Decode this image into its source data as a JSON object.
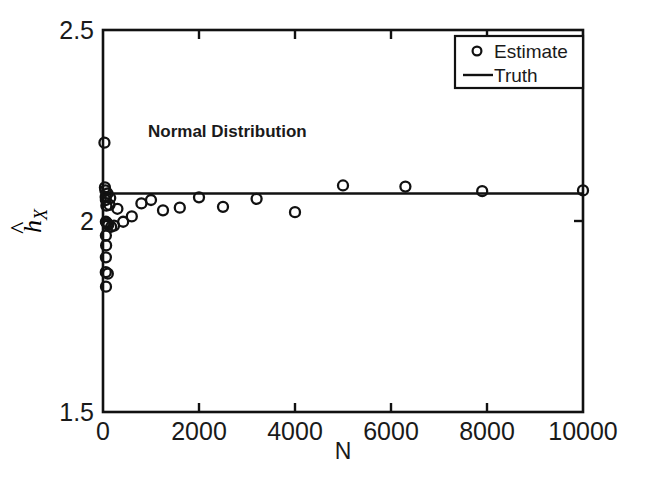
{
  "chart_data": {
    "type": "scatter",
    "title": "",
    "annotation": "Normal Distribution",
    "xlabel": "N",
    "ylabel": "ĥ_X",
    "xlim": [
      0,
      10000
    ],
    "ylim": [
      1.5,
      2.5
    ],
    "xticks": [
      0,
      2000,
      4000,
      6000,
      8000,
      10000
    ],
    "xticklabels": [
      "0",
      "2000",
      "4000",
      "6000",
      "8000",
      "10000"
    ],
    "yticks": [
      1.5,
      2.0,
      2.5
    ],
    "yticklabels": [
      "1.5",
      "2",
      "2.5"
    ],
    "grid": false,
    "legend_position": "upper right",
    "series": [
      {
        "name": "Estimate",
        "type": "scatter",
        "marker": "open-circle",
        "color": "#111111",
        "points": [
          [
            30,
            2.205
          ],
          [
            40,
            2.088
          ],
          [
            50,
            2.08
          ],
          [
            55,
            2.063
          ],
          [
            60,
            2.055
          ],
          [
            95,
            2.072
          ],
          [
            150,
            2.06
          ],
          [
            70,
            2.04
          ],
          [
            135,
            2.042
          ],
          [
            60,
            1.998
          ],
          [
            75,
            1.996
          ],
          [
            95,
            1.992
          ],
          [
            110,
            1.99
          ],
          [
            170,
            1.985
          ],
          [
            230,
            1.988
          ],
          [
            300,
            2.032
          ],
          [
            60,
            1.962
          ],
          [
            65,
            1.936
          ],
          [
            60,
            1.905
          ],
          [
            58,
            1.866
          ],
          [
            100,
            1.862
          ],
          [
            62,
            1.828
          ],
          [
            420,
            1.998
          ],
          [
            600,
            2.012
          ],
          [
            800,
            2.046
          ],
          [
            1000,
            2.055
          ],
          [
            1250,
            2.028
          ],
          [
            1600,
            2.035
          ],
          [
            2000,
            2.062
          ],
          [
            2500,
            2.037
          ],
          [
            3200,
            2.058
          ],
          [
            4000,
            2.023
          ],
          [
            5000,
            2.093
          ],
          [
            6300,
            2.09
          ],
          [
            7900,
            2.078
          ],
          [
            10000,
            2.08
          ]
        ]
      },
      {
        "name": "Truth",
        "type": "line",
        "color": "#111111",
        "value": 2.072,
        "points": [
          [
            0,
            2.072
          ],
          [
            10000,
            2.072
          ]
        ]
      }
    ],
    "legend_entries": [
      {
        "label": "Estimate",
        "marker": "open-circle"
      },
      {
        "label": "Truth",
        "marker": "line"
      }
    ]
  },
  "axis": {
    "x_label": "N",
    "y_label_base": "h",
    "y_label_hat": "̂",
    "y_label_sub": "X",
    "x_tick_0": "0",
    "x_tick_1": "2000",
    "x_tick_2": "4000",
    "x_tick_3": "6000",
    "x_tick_4": "8000",
    "x_tick_5": "10000",
    "y_tick_0": "1.5",
    "y_tick_1": "2",
    "y_tick_2": "2.5"
  },
  "annotations": {
    "distribution": "Normal Distribution"
  },
  "legend": {
    "estimate_label": "Estimate",
    "truth_label": "Truth"
  },
  "style": {
    "axis_color": "#111111",
    "marker_color": "#111111",
    "line_color": "#111111",
    "background": "#ffffff"
  }
}
